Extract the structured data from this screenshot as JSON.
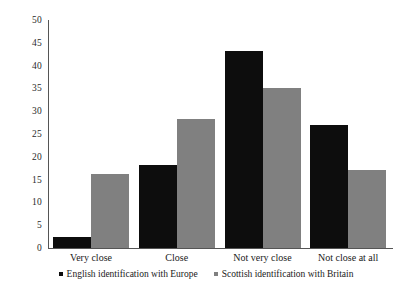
{
  "chart_data": {
    "type": "bar",
    "title": "",
    "subtitle": "",
    "xlabel": "",
    "ylabel": "",
    "ylim": [
      0,
      50
    ],
    "y_ticks": [
      0,
      5,
      10,
      15,
      20,
      25,
      30,
      35,
      40,
      45,
      50
    ],
    "grid": false,
    "legend_position": "bottom",
    "categories": [
      "Very close",
      "Close",
      "Not very close",
      "Not close at all"
    ],
    "series": [
      {
        "name": "English identification with Europe",
        "color": "#0d0d0d",
        "values": [
          2.5,
          18.3,
          43.1,
          27.0
        ]
      },
      {
        "name": "Scottish identification with Britain",
        "color": "#808080",
        "values": [
          16.3,
          28.2,
          35.2,
          17.0
        ]
      }
    ]
  },
  "axis": {
    "tick_labels": [
      "50",
      "45",
      "40",
      "35",
      "30",
      "25",
      "20",
      "15",
      "10",
      "5",
      "0"
    ]
  },
  "legend": {
    "items": [
      {
        "label": "English identification with Europe",
        "color": "#0d0d0d"
      },
      {
        "label": "Scottish identification with Britain",
        "color": "#808080"
      }
    ]
  }
}
